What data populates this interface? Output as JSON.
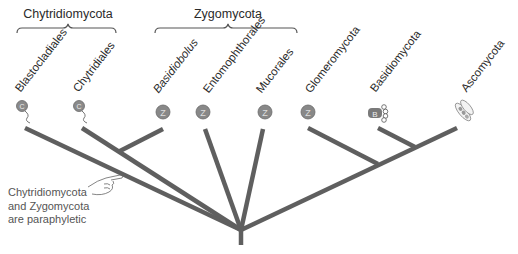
{
  "colors": {
    "branch": "#5f5f5f",
    "brace": "#555555",
    "icon_fill": "#8a8a8a",
    "text": "#2a2a2a",
    "note_text": "#555555"
  },
  "groups": [
    {
      "label": "Chytridiomycota",
      "x_start": 17,
      "x_end": 116
    },
    {
      "label": "Zygomycota",
      "x_start": 155,
      "x_end": 297
    }
  ],
  "taxa": [
    {
      "label": "Blastocladiales",
      "italic": false,
      "icon": "chytrid-zoospore-icon",
      "icon_letter": "C"
    },
    {
      "label": "Chytridiales",
      "italic": false,
      "icon": "chytrid-zoospore-icon",
      "icon_letter": "C"
    },
    {
      "label": "Basidiobolus",
      "italic": true,
      "icon": "zygospore-icon",
      "icon_letter": "Z"
    },
    {
      "label": "Entomophthorales",
      "italic": false,
      "icon": "zygospore-icon",
      "icon_letter": "Z"
    },
    {
      "label": "Mucorales",
      "italic": false,
      "icon": "zygospore-icon",
      "icon_letter": "Z"
    },
    {
      "label": "Glomeromycota",
      "italic": false,
      "icon": "zygospore-icon",
      "icon_letter": "Z"
    },
    {
      "label": "Basidiomycota",
      "italic": false,
      "icon": "basidium-icon",
      "icon_letter": "B"
    },
    {
      "label": "Ascomycota",
      "italic": false,
      "icon": "ascus-icon",
      "icon_letter": "A"
    }
  ],
  "annotation": {
    "icon": "pointing-hand-icon",
    "lines": [
      "Chytridiomycota",
      "and Zygomycota",
      "are paraphyletic"
    ]
  }
}
